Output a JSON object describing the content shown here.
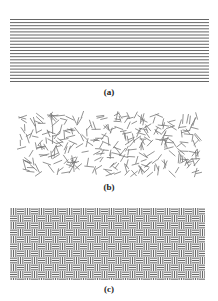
{
  "figure": {
    "panels": [
      {
        "id": "a",
        "label": "(a)",
        "description": "aligned parallel fibers",
        "pattern": "horizontal-lines",
        "bounds": {
          "x": 10,
          "y": 19,
          "w": 199,
          "h": 63
        },
        "line_count": 21,
        "line_color": "#555555"
      },
      {
        "id": "b",
        "label": "(b)",
        "description": "randomly oriented short fibers",
        "pattern": "random-short-segments",
        "bounds": {
          "x": 17,
          "y": 111,
          "w": 187,
          "h": 67
        },
        "segment_count": 330,
        "segment_length": 8,
        "line_color": "#777777"
      },
      {
        "id": "c",
        "label": "(c)",
        "description": "woven basket-weave fibers",
        "pattern": "basket-weave",
        "bounds": {
          "x": 10,
          "y": 208,
          "w": 195,
          "h": 72
        },
        "block_size": 7,
        "lines_per_block": 3,
        "line_color": "#666666",
        "fill_color": "#d8d8d8"
      }
    ]
  }
}
